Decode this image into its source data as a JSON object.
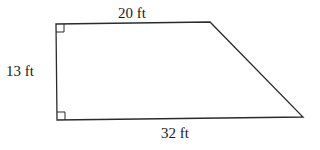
{
  "figure": {
    "shape": "right trapezoid",
    "line_color": "#2b2b2b",
    "background": "#ffffff",
    "vertices": {
      "top_left": [
        56,
        24
      ],
      "top_right": [
        210,
        22
      ],
      "bottom_right": [
        303,
        117
      ],
      "bottom_left": [
        57,
        120
      ]
    },
    "right_angle_markers": [
      "top_left",
      "bottom_left"
    ],
    "labels": {
      "top": "20 ft",
      "left": "13 ft",
      "bottom": "32 ft"
    }
  }
}
